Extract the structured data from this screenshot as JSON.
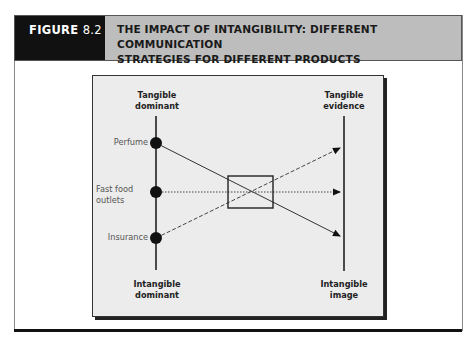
{
  "figure": {
    "label_prefix": "FIGURE ",
    "label_number": "8.2",
    "title_line1": "THE IMPACT OF INTANGIBILITY: DIFFERENT COMMUNICATION",
    "title_line2": "STRATEGIES FOR DIFFERENT PRODUCTS"
  },
  "diagram": {
    "left_axis": {
      "top_line1": "Tangible",
      "top_line2": "dominant",
      "bottom_line1": "Intangible",
      "bottom_line2": "dominant"
    },
    "right_axis": {
      "top_line1": "Tangible",
      "top_line2": "evidence",
      "bottom_line1": "Intangible",
      "bottom_line2": "image"
    },
    "products": [
      {
        "label_line1": "Perfume",
        "label_line2": "",
        "line_style": "solid",
        "target": "Intangible image"
      },
      {
        "label_line1": "Fast food",
        "label_line2": "outlets",
        "line_style": "dotted",
        "target": "middle"
      },
      {
        "label_line1": "Insurance",
        "label_line2": "",
        "line_style": "dashed",
        "target": "Tangible evidence"
      }
    ],
    "colors": {
      "header_dark": "#111111",
      "header_light": "#bdbdbd",
      "diagram_bg": "#ececec"
    }
  }
}
